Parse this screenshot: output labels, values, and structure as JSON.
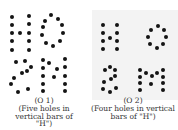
{
  "panels": [
    {
      "id": "O1",
      "label": "(O 1)",
      "desc1": "(Five holes in",
      "desc2": "vertical bars of",
      "desc3": "\"H\")",
      "letters": [
        "H",
        "O",
        "S",
        "M"
      ],
      "dots": [
        [
          12,
          17
        ],
        [
          12,
          25
        ],
        [
          12,
          33
        ],
        [
          12,
          41
        ],
        [
          12,
          50
        ],
        [
          29,
          16
        ],
        [
          29,
          24
        ],
        [
          29,
          33
        ],
        [
          29,
          41
        ],
        [
          29,
          50
        ],
        [
          20,
          33
        ],
        [
          51,
          15
        ],
        [
          58,
          19
        ],
        [
          62,
          25
        ],
        [
          63,
          33
        ],
        [
          60,
          41
        ],
        [
          53,
          46
        ],
        [
          46,
          43
        ],
        [
          42,
          35
        ],
        [
          43,
          27
        ],
        [
          45,
          21
        ],
        [
          16,
          62
        ],
        [
          25,
          61
        ],
        [
          31,
          67
        ],
        [
          22,
          73
        ],
        [
          14,
          78
        ],
        [
          27,
          71
        ],
        [
          11,
          84
        ],
        [
          18,
          92
        ],
        [
          28,
          89
        ],
        [
          43,
          60
        ],
        [
          43,
          68
        ],
        [
          43,
          76
        ],
        [
          43,
          84
        ],
        [
          43,
          91
        ],
        [
          65,
          59
        ],
        [
          65,
          67
        ],
        [
          65,
          76
        ],
        [
          65,
          84
        ],
        [
          65,
          91
        ],
        [
          49,
          63
        ],
        [
          57,
          69
        ],
        [
          54,
          77
        ]
      ]
    },
    {
      "id": "O2",
      "label": "(O 2)",
      "desc1": "(Four holes in vertical",
      "desc2": "bars of \"H\")",
      "letters": [
        "H",
        "O",
        "S",
        "M"
      ],
      "dots": [
        [
          15,
          25
        ],
        [
          15,
          33
        ],
        [
          15,
          41
        ],
        [
          15,
          49
        ],
        [
          29,
          25
        ],
        [
          29,
          33
        ],
        [
          29,
          41
        ],
        [
          29,
          49
        ],
        [
          22,
          38
        ],
        [
          70,
          26
        ],
        [
          76,
          30
        ],
        [
          78,
          37
        ],
        [
          75,
          44
        ],
        [
          69,
          48
        ],
        [
          62,
          44
        ],
        [
          60,
          37
        ],
        [
          63,
          30
        ],
        [
          17,
          70
        ],
        [
          22,
          67
        ],
        [
          27,
          70
        ],
        [
          16,
          82
        ],
        [
          23,
          79
        ],
        [
          27,
          76
        ],
        [
          15,
          89
        ],
        [
          22,
          92
        ],
        [
          28,
          88
        ],
        [
          52,
          70
        ],
        [
          52,
          77
        ],
        [
          52,
          83
        ],
        [
          52,
          90
        ],
        [
          75,
          70
        ],
        [
          75,
          77
        ],
        [
          75,
          83
        ],
        [
          75,
          90
        ],
        [
          58,
          73
        ],
        [
          64,
          76
        ],
        [
          69,
          73
        ],
        [
          63,
          84
        ]
      ]
    }
  ]
}
